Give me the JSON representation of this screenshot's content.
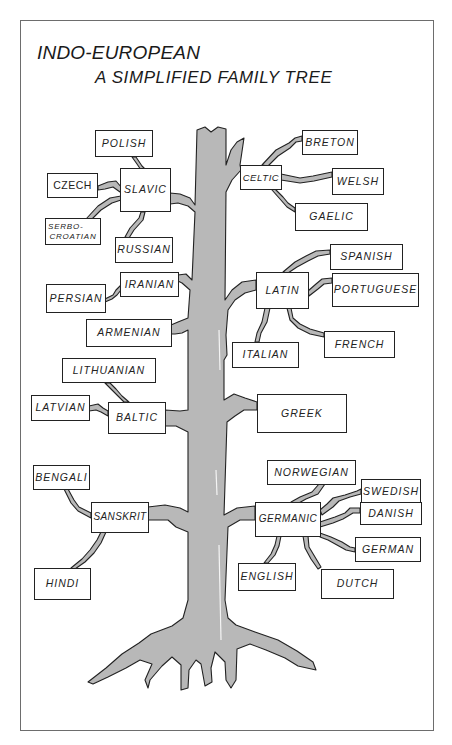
{
  "title": {
    "line1": "INDO-EUROPEAN",
    "line2": "A SIMPLIFIED FAMILY TREE"
  },
  "colors": {
    "trunk": "#b8b8b8",
    "outline": "#222222",
    "border": "#6d6d6d"
  },
  "branches": {
    "slavic": {
      "label": "SLAVIC",
      "children": {
        "polish": "POLISH",
        "czech": "CZECH",
        "serbo_line1": "SERBO-",
        "serbo_line2": "CROATIAN",
        "russian": "RUSSIAN"
      }
    },
    "celtic": {
      "label": "CELTIC",
      "children": {
        "breton": "BRETON",
        "welsh": "WELSH",
        "gaelic": "GAELIC"
      }
    },
    "iranian": {
      "label": "IRANIAN",
      "children": {
        "persian": "PERSIAN"
      }
    },
    "latin": {
      "label": "LATIN",
      "children": {
        "spanish": "SPANISH",
        "portuguese": "PORTUGUESE",
        "italian": "ITALIAN",
        "french": "FRENCH"
      }
    },
    "armenian": {
      "label": "ARMENIAN"
    },
    "baltic": {
      "label": "BALTIC",
      "children": {
        "lithuanian": "LITHUANIAN",
        "latvian": "LATVIAN"
      }
    },
    "greek": {
      "label": "GREEK"
    },
    "sanskrit": {
      "label": "SANSKRIT",
      "children": {
        "bengali": "BENGALI",
        "hindi": "HINDI"
      }
    },
    "germanic": {
      "label": "GERMANIC",
      "children": {
        "norwegian": "NORWEGIAN",
        "swedish": "SWEDISH",
        "danish": "DANISH",
        "german": "GERMAN",
        "english": "ENGLISH",
        "dutch": "DUTCH"
      }
    }
  }
}
